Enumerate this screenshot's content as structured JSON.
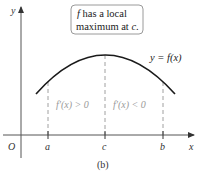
{
  "figure": {
    "caption": "(b)",
    "annotation_box": {
      "line1": "f has a local",
      "line1_var": "f",
      "line1_rest": " has a local",
      "line2": "maximum at c.",
      "line2_rest": "maximum at ",
      "line2_var": "c",
      "line2_end": "."
    },
    "curve_label": "y = f(x)",
    "axes": {
      "x_label": "x",
      "y_label": "y",
      "origin_label": "O"
    },
    "ticks": [
      {
        "label": "a",
        "x": 48
      },
      {
        "label": "c",
        "x": 105
      },
      {
        "label": "b",
        "x": 163
      }
    ],
    "regions": [
      {
        "label": "f′(x) > 0"
      },
      {
        "label": "f′(x) < 0"
      }
    ],
    "colors": {
      "curve": "#1a1a1a",
      "axes": "#333333",
      "dashed": "#888888",
      "region_text": "#9a9a9a",
      "box_border": "#9a9a9a"
    }
  }
}
